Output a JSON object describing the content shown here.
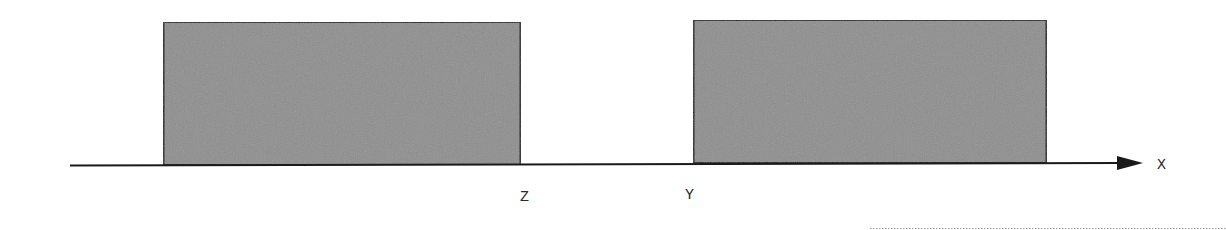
{
  "diagram": {
    "type": "1d-interval-diagram",
    "axis": {
      "label": "X",
      "direction": "right",
      "color": "#1a1a1a"
    },
    "intervals": [
      {
        "name": "left-block",
        "end_label": "Z",
        "fill": "#8f8f8f",
        "stroke": "#1a1a1a"
      },
      {
        "name": "right-block",
        "start_label": "Y",
        "fill": "#8f8f8f",
        "stroke": "#1a1a1a"
      }
    ],
    "labels": {
      "z": "Z",
      "y": "Y",
      "x": "X"
    }
  }
}
